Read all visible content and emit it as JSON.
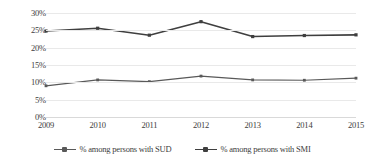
{
  "chart_data": {
    "type": "line",
    "title": "",
    "xlabel": "",
    "ylabel": "",
    "categories": [
      "2009",
      "2010",
      "2011",
      "2012",
      "2013",
      "2014",
      "2015"
    ],
    "ylim": [
      0,
      30
    ],
    "ytick_labels": [
      "0%",
      "5%",
      "10%",
      "15%",
      "20%",
      "25%",
      "30%"
    ],
    "ytick_values": [
      0,
      5,
      10,
      15,
      20,
      25,
      30
    ],
    "grid": true,
    "legend_position": "bottom",
    "series": [
      {
        "name": "% among persons with SUD",
        "color": "#595959",
        "values": [
          9.0,
          10.7,
          10.2,
          11.8,
          10.7,
          10.6,
          11.2
        ]
      },
      {
        "name": "% among persons with SMI",
        "color": "#3f3f3f",
        "values": [
          24.8,
          25.6,
          23.6,
          27.5,
          23.2,
          23.5,
          23.7
        ]
      }
    ]
  },
  "axis": {
    "grid_color": "#e9e9e9",
    "tick_text_color": "#3d3d3d"
  }
}
